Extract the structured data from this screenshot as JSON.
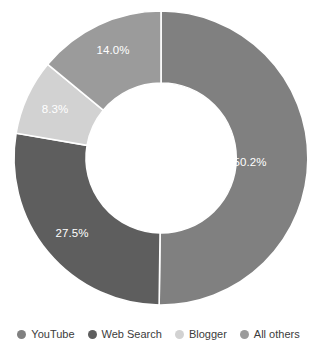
{
  "chart_data": {
    "type": "pie",
    "variant": "donut",
    "title": "",
    "subtitle": "",
    "xlabel": "",
    "ylabel": "",
    "grid": false,
    "legend_position": "bottom",
    "start_angle_deg": 0,
    "direction": "clockwise",
    "units": "percent",
    "categories": [
      "YouTube",
      "Web Search",
      "Blogger",
      "All others"
    ],
    "values": [
      50.2,
      27.5,
      8.3,
      14.0
    ],
    "data_labels": [
      "50.2%",
      "27.5%",
      "8.3%",
      "14.0%"
    ],
    "colors": [
      "#808080",
      "#5e5e5e",
      "#d2d2d2",
      "#9b9b9b"
    ],
    "slices": [
      {
        "name": "YouTube",
        "value": 50.2,
        "label": "50.2%",
        "color": "#808080",
        "start_deg": 0,
        "end_deg": 180.72,
        "label_x": 250,
        "label_y": 163
      },
      {
        "name": "Web Search",
        "value": 27.5,
        "label": "27.5%",
        "color": "#5e5e5e",
        "start_deg": 180.72,
        "end_deg": 279.72,
        "label_x": 72,
        "label_y": 234
      },
      {
        "name": "Blogger",
        "value": 8.3,
        "label": "8.3%",
        "color": "#d2d2d2",
        "start_deg": 279.72,
        "end_deg": 309.6,
        "label_x": 55,
        "label_y": 110
      },
      {
        "name": "All others",
        "value": 14.0,
        "label": "14.0%",
        "color": "#9b9b9b",
        "start_deg": 309.6,
        "end_deg": 360,
        "label_x": 113,
        "label_y": 51
      }
    ]
  },
  "donut": {
    "center_x": 161,
    "center_y": 158,
    "outer_radius": 147,
    "inner_radius": 75,
    "gap_color": "#ffffff",
    "gap_width": 1.6
  },
  "legend": {
    "items": [
      {
        "label": "YouTube",
        "color": "#808080"
      },
      {
        "label": "Web Search",
        "color": "#5e5e5e"
      },
      {
        "label": "Blogger",
        "color": "#d2d2d2"
      },
      {
        "label": "All others",
        "color": "#9b9b9b"
      }
    ]
  },
  "background": "#ffffff"
}
